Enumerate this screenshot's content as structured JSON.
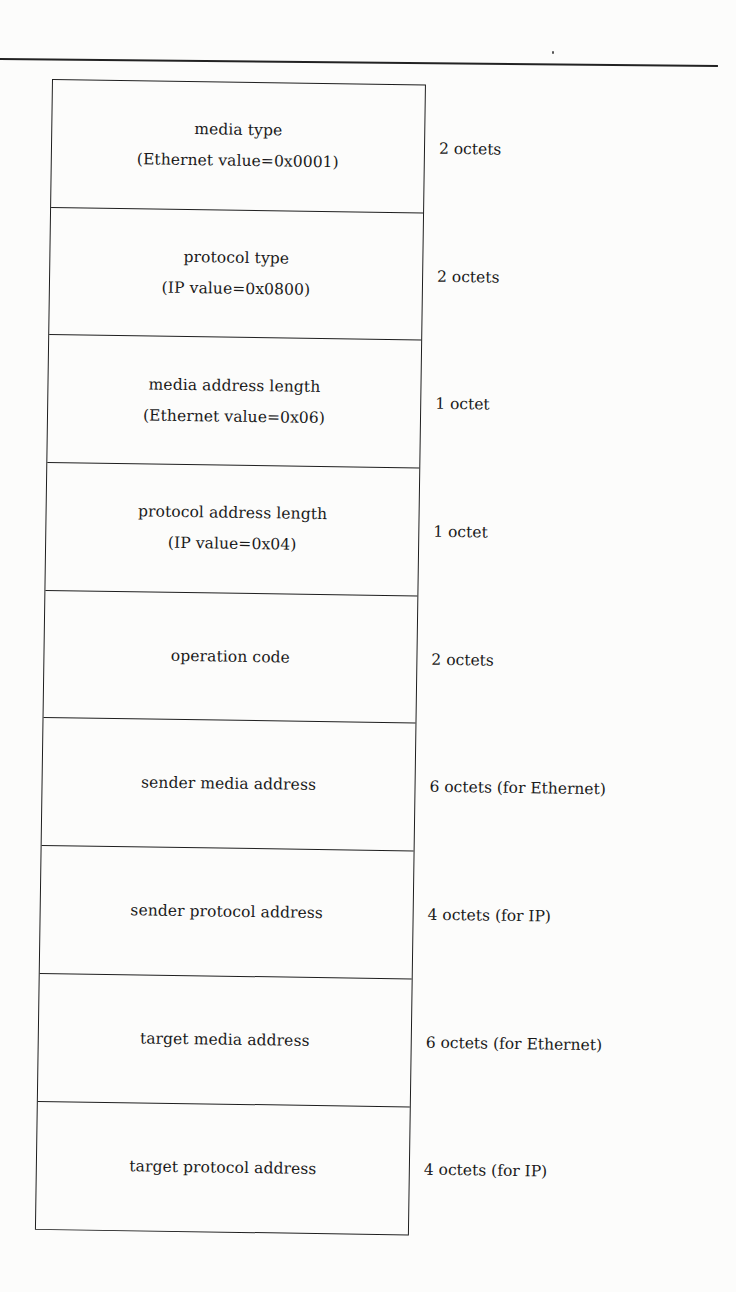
{
  "diagram": {
    "fields": [
      {
        "name": "media type",
        "value": "(Ethernet value=0x0001)",
        "size": "2 octets"
      },
      {
        "name": "protocol type",
        "value": "(IP value=0x0800)",
        "size": "2 octets"
      },
      {
        "name": "media address length",
        "value": "(Ethernet value=0x06)",
        "size": "1 octet"
      },
      {
        "name": "protocol address length",
        "value": "(IP value=0x04)",
        "size": "1 octet"
      },
      {
        "name": "operation code",
        "value": "",
        "size": "2 octets"
      },
      {
        "name": "sender media address",
        "value": "",
        "size": "6 octets (for Ethernet)"
      },
      {
        "name": "sender protocol address",
        "value": "",
        "size": "4 octets (for IP)"
      },
      {
        "name": "target media address",
        "value": "",
        "size": "6 octets (for Ethernet)"
      },
      {
        "name": "target protocol address",
        "value": "",
        "size": "4 octets (for IP)"
      }
    ]
  },
  "colors": {
    "background": "#fcfcfb",
    "ink": "#1e1e1e"
  }
}
